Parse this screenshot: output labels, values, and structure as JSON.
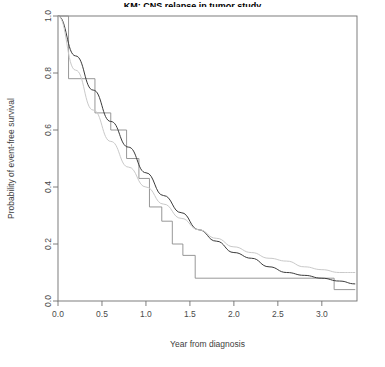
{
  "chart_data": {
    "type": "line",
    "title": "KM: CNS relapse in tumor study",
    "title_visible": "partially cropped at top edge",
    "xlabel": "Year from diagnosis",
    "ylabel": "Probability of event-free survival",
    "xlim": [
      0,
      3.4
    ],
    "ylim": [
      0,
      1.0
    ],
    "xticks": [
      0.0,
      0.5,
      1.0,
      1.5,
      2.0,
      2.5,
      3.0
    ],
    "xticklabels": [
      "0.0",
      "0.5",
      "1.0",
      "1.5",
      "2.0",
      "2.5",
      "3.0"
    ],
    "yticks": [
      0.0,
      0.2,
      0.4,
      0.6,
      0.8,
      1.0
    ],
    "yticklabels": [
      "0.0",
      "0.2",
      "0.4",
      "0.6",
      "0.8",
      "1.0"
    ],
    "grid": false,
    "legend": "none",
    "series": [
      {
        "name": "Kaplan-Meier step estimate",
        "type": "step",
        "color": "#8c8c8c",
        "width": 0.9,
        "x": [
          0.0,
          0.12,
          0.12,
          0.42,
          0.42,
          0.6,
          0.6,
          0.78,
          0.78,
          0.92,
          0.92,
          1.04,
          1.04,
          1.18,
          1.18,
          1.3,
          1.3,
          1.42,
          1.42,
          1.56,
          1.56,
          3.14,
          3.14,
          3.38
        ],
        "y": [
          1.0,
          1.0,
          0.78,
          0.78,
          0.66,
          0.66,
          0.6,
          0.6,
          0.5,
          0.5,
          0.43,
          0.43,
          0.33,
          0.33,
          0.28,
          0.28,
          0.2,
          0.2,
          0.16,
          0.16,
          0.08,
          0.08,
          0.04,
          0.04
        ]
      },
      {
        "name": "Fitted parametric curve (dark)",
        "type": "line",
        "color": "#3a3a3a",
        "width": 1.0,
        "x": [
          0.0,
          0.2,
          0.4,
          0.6,
          0.8,
          1.0,
          1.2,
          1.4,
          1.6,
          1.8,
          2.0,
          2.2,
          2.4,
          2.6,
          2.8,
          3.0,
          3.2,
          3.38
        ],
        "y": [
          1.0,
          0.86,
          0.74,
          0.63,
          0.54,
          0.45,
          0.37,
          0.31,
          0.25,
          0.21,
          0.17,
          0.15,
          0.12,
          0.1,
          0.09,
          0.08,
          0.07,
          0.06
        ]
      },
      {
        "name": "Reference exponential curve (light)",
        "type": "line",
        "color": "#c9c9c9",
        "width": 1.0,
        "x": [
          0.0,
          0.2,
          0.4,
          0.6,
          0.8,
          1.0,
          1.2,
          1.4,
          1.6,
          1.8,
          2.0,
          2.2,
          2.4,
          2.6,
          2.8,
          3.0,
          3.2,
          3.38
        ],
        "y": [
          1.0,
          0.81,
          0.67,
          0.56,
          0.47,
          0.4,
          0.34,
          0.29,
          0.25,
          0.22,
          0.19,
          0.17,
          0.15,
          0.14,
          0.12,
          0.11,
          0.1,
          0.1
        ]
      }
    ]
  },
  "colors": {
    "frame": "#6f6f6f",
    "step": "#8c8c8c",
    "fit": "#3a3a3a",
    "reference": "#c9c9c9",
    "text": "#3d3d3d"
  }
}
